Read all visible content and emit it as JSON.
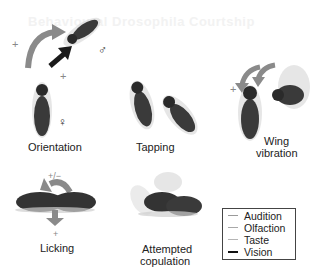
{
  "figure": {
    "ghost_header": "Behavioural Drosophila Courtship",
    "panels": [
      {
        "id": "orientation",
        "label": "Orientation",
        "marks": [
          "+",
          "+"
        ],
        "symbols": {
          "male": "♂",
          "female": "♀"
        }
      },
      {
        "id": "tapping",
        "label": "Tapping"
      },
      {
        "id": "wing-vibration",
        "label_line1": "Wing",
        "label_line2": "vibration",
        "marks": [
          "+"
        ]
      },
      {
        "id": "licking",
        "label": "Licking",
        "marks": [
          "+/−",
          "+"
        ]
      },
      {
        "id": "attempted-copulation",
        "label_line1": "Attempted",
        "label_line2": "copulation"
      }
    ],
    "legend": {
      "items": [
        {
          "label": "Audition",
          "color": "#9a9a9a"
        },
        {
          "label": "Olfaction",
          "color": "#a8a8a8"
        },
        {
          "label": "Taste",
          "color": "#b5b5b5"
        },
        {
          "label": "Vision",
          "color": "#111111"
        }
      ]
    },
    "colors": {
      "arrow_gray": "#8a8a8a",
      "arrow_dark": "#1a1a1a",
      "fly_body": "#3a3a3a",
      "fly_wing": "#d8d8d8"
    }
  }
}
